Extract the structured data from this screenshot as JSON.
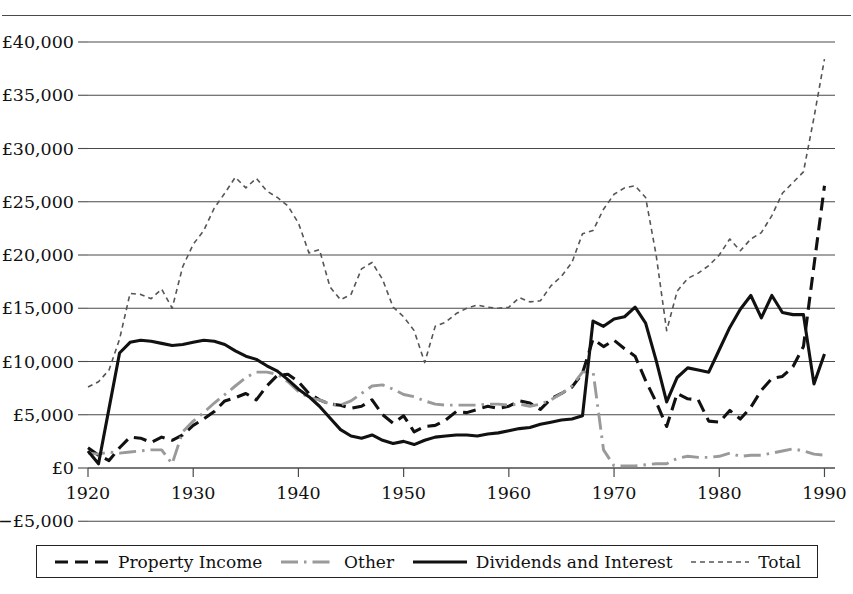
{
  "figure": {
    "caption_fragment": "",
    "background": "#ffffff"
  },
  "axes": {
    "y_ticks": [
      "£40,000",
      "£35,000",
      "£30,000",
      "£25,000",
      "£20,000",
      "£15,000",
      "£10,000",
      "£5,000",
      "£0",
      "−£5,000"
    ],
    "x_ticks": [
      "1920",
      "1930",
      "1940",
      "1950",
      "1960",
      "1970",
      "1980",
      "1990"
    ]
  },
  "legend": {
    "items": [
      {
        "label": "Property Income",
        "style": "dashed",
        "color": "#111111"
      },
      {
        "label": "Other",
        "style": "dashdot",
        "color": "#9a9a9a"
      },
      {
        "label": "Dividends and Interest",
        "style": "solid",
        "color": "#111111"
      },
      {
        "label": "Total",
        "style": "dotted",
        "color": "#555555"
      }
    ]
  },
  "chart_data": {
    "type": "line",
    "title": "",
    "xlabel": "",
    "ylabel": "",
    "xlim": [
      1920,
      1991
    ],
    "ylim": [
      -5000,
      40000
    ],
    "ytick_values": [
      40000,
      35000,
      30000,
      25000,
      20000,
      15000,
      10000,
      5000,
      0,
      -5000
    ],
    "xtick_values": [
      1920,
      1930,
      1940,
      1950,
      1960,
      1970,
      1980,
      1990
    ],
    "grid": "horizontal",
    "legend_position": "bottom",
    "currency": "GBP",
    "series": [
      {
        "name": "Property Income",
        "style": "dashed",
        "color": "#111111",
        "x": [
          1920,
          1921,
          1922,
          1923,
          1924,
          1925,
          1926,
          1927,
          1928,
          1929,
          1930,
          1931,
          1932,
          1933,
          1934,
          1935,
          1936,
          1937,
          1938,
          1939,
          1940,
          1941,
          1942,
          1943,
          1944,
          1945,
          1946,
          1947,
          1948,
          1949,
          1950,
          1951,
          1952,
          1953,
          1954,
          1955,
          1956,
          1957,
          1958,
          1959,
          1960,
          1961,
          1962,
          1963,
          1964,
          1965,
          1966,
          1967,
          1968,
          1969,
          1970,
          1971,
          1972,
          1973,
          1974,
          1975,
          1976,
          1977,
          1978,
          1979,
          1980,
          1981,
          1982,
          1983,
          1984,
          1985,
          1986,
          1987,
          1988,
          1989,
          1990
        ],
        "y": [
          1900,
          1200,
          700,
          1900,
          2900,
          2800,
          2400,
          2900,
          2600,
          3100,
          4000,
          4600,
          5300,
          6300,
          6600,
          7000,
          6400,
          7700,
          8700,
          8800,
          8100,
          7000,
          6400,
          6000,
          5900,
          5600,
          5800,
          6400,
          5000,
          4200,
          4900,
          3400,
          3900,
          4000,
          4500,
          5300,
          5200,
          5500,
          5800,
          5600,
          5800,
          6300,
          6100,
          5500,
          6500,
          7000,
          7600,
          8900,
          12100,
          11400,
          12000,
          11200,
          10500,
          8200,
          6200,
          3900,
          7000,
          6500,
          6400,
          4400,
          4300,
          5400,
          4600,
          5700,
          7300,
          8400,
          8600,
          9500,
          11400,
          19000,
          26500
        ]
      },
      {
        "name": "Other",
        "style": "dashdot",
        "color": "#9a9a9a",
        "x": [
          1920,
          1921,
          1922,
          1923,
          1924,
          1925,
          1926,
          1927,
          1928,
          1929,
          1930,
          1931,
          1932,
          1933,
          1934,
          1935,
          1936,
          1937,
          1938,
          1939,
          1940,
          1941,
          1942,
          1943,
          1944,
          1945,
          1946,
          1947,
          1948,
          1949,
          1950,
          1951,
          1952,
          1953,
          1954,
          1955,
          1956,
          1957,
          1958,
          1959,
          1960,
          1961,
          1962,
          1963,
          1964,
          1965,
          1966,
          1967,
          1968,
          1969,
          1970,
          1971,
          1972,
          1973,
          1974,
          1975,
          1976,
          1977,
          1978,
          1979,
          1980,
          1981,
          1982,
          1983,
          1984,
          1985,
          1986,
          1987,
          1988,
          1989,
          1990
        ],
        "y": [
          1400,
          1300,
          1500,
          1400,
          1500,
          1600,
          1700,
          1700,
          400,
          3400,
          4400,
          5200,
          6100,
          6900,
          7700,
          8500,
          9000,
          9000,
          8800,
          8100,
          7200,
          6600,
          6400,
          6000,
          5900,
          6300,
          7000,
          7700,
          7800,
          7400,
          6900,
          6700,
          6300,
          6000,
          5900,
          5900,
          5900,
          5900,
          6000,
          6000,
          5900,
          6000,
          5800,
          6000,
          6400,
          7000,
          7700,
          9000,
          9100,
          1700,
          200,
          200,
          200,
          300,
          400,
          400,
          900,
          1100,
          1000,
          1000,
          1100,
          1400,
          1100,
          1200,
          1200,
          1400,
          1600,
          1800,
          1600,
          1300,
          1200
        ]
      },
      {
        "name": "Dividends and Interest",
        "style": "solid",
        "color": "#111111",
        "x": [
          1920,
          1921,
          1922,
          1923,
          1924,
          1925,
          1926,
          1927,
          1928,
          1929,
          1930,
          1931,
          1932,
          1933,
          1934,
          1935,
          1936,
          1937,
          1938,
          1939,
          1940,
          1941,
          1942,
          1943,
          1944,
          1945,
          1946,
          1947,
          1948,
          1949,
          1950,
          1951,
          1952,
          1953,
          1954,
          1955,
          1956,
          1957,
          1958,
          1959,
          1960,
          1961,
          1962,
          1963,
          1964,
          1965,
          1966,
          1967,
          1968,
          1969,
          1970,
          1971,
          1972,
          1973,
          1974,
          1975,
          1976,
          1977,
          1978,
          1979,
          1980,
          1981,
          1982,
          1983,
          1984,
          1985,
          1986,
          1987,
          1988,
          1989,
          1990
        ],
        "y": [
          1600,
          400,
          5600,
          10800,
          11800,
          12000,
          11900,
          11700,
          11500,
          11600,
          11800,
          12000,
          11900,
          11600,
          11000,
          10500,
          10200,
          9600,
          9100,
          8300,
          7400,
          6700,
          5800,
          4700,
          3600,
          3000,
          2800,
          3100,
          2600,
          2300,
          2500,
          2200,
          2600,
          2900,
          3000,
          3100,
          3100,
          3000,
          3200,
          3300,
          3500,
          3700,
          3800,
          4100,
          4300,
          4500,
          4600,
          4900,
          13800,
          13300,
          14000,
          14200,
          15100,
          13600,
          10100,
          6200,
          8500,
          9400,
          9200,
          9000,
          11100,
          13200,
          14900,
          16200,
          14100,
          16200,
          14600,
          14400,
          14400,
          7900,
          10700
        ]
      },
      {
        "name": "Total",
        "style": "dotted",
        "color": "#555555",
        "x": [
          1920,
          1921,
          1922,
          1923,
          1924,
          1925,
          1926,
          1927,
          1928,
          1929,
          1930,
          1931,
          1932,
          1933,
          1934,
          1935,
          1936,
          1937,
          1938,
          1939,
          1940,
          1941,
          1942,
          1943,
          1944,
          1945,
          1946,
          1947,
          1948,
          1949,
          1950,
          1951,
          1952,
          1953,
          1954,
          1955,
          1956,
          1957,
          1958,
          1959,
          1960,
          1961,
          1962,
          1963,
          1964,
          1965,
          1966,
          1967,
          1968,
          1969,
          1970,
          1971,
          1972,
          1973,
          1974,
          1975,
          1976,
          1977,
          1978,
          1979,
          1980,
          1981,
          1982,
          1983,
          1984,
          1985,
          1986,
          1987,
          1988,
          1989,
          1990
        ],
        "y": [
          7600,
          8100,
          9200,
          12100,
          16400,
          16300,
          15900,
          16800,
          15000,
          18900,
          21000,
          22300,
          24400,
          25800,
          27300,
          26300,
          27200,
          26000,
          25400,
          24600,
          23000,
          20200,
          20500,
          17000,
          15800,
          16300,
          18700,
          19300,
          17700,
          15100,
          14200,
          12900,
          9900,
          13300,
          13700,
          14500,
          15000,
          15300,
          15100,
          15000,
          15100,
          16000,
          15600,
          15700,
          17100,
          18000,
          19300,
          22000,
          22300,
          24300,
          25700,
          26300,
          26500,
          25400,
          20000,
          12900,
          16600,
          17800,
          18300,
          19000,
          20000,
          21500,
          20400,
          21500,
          22100,
          23700,
          25800,
          26800,
          27800,
          32900,
          38400
        ]
      }
    ]
  }
}
